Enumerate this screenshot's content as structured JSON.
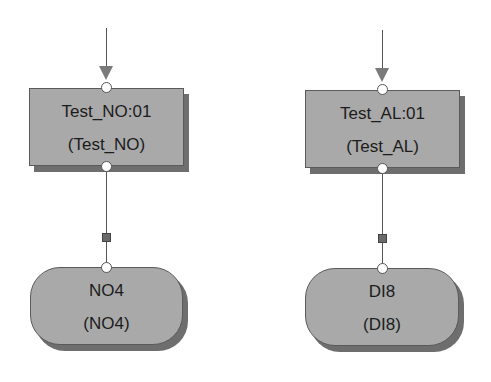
{
  "diagram": {
    "columns": [
      {
        "step": {
          "name": "Test_NO:01",
          "type": "(Test_NO)"
        },
        "io": {
          "name": "NO4",
          "type": "(NO4)"
        }
      },
      {
        "step": {
          "name": "Test_AL:01",
          "type": "(Test_AL)"
        },
        "io": {
          "name": "DI8",
          "type": "(DI8)"
        }
      }
    ],
    "colors": {
      "node_fill": "#a9a9a9",
      "node_shadow": "#6e6e6e",
      "line": "#555555",
      "port_fill": "#ffffff"
    }
  }
}
